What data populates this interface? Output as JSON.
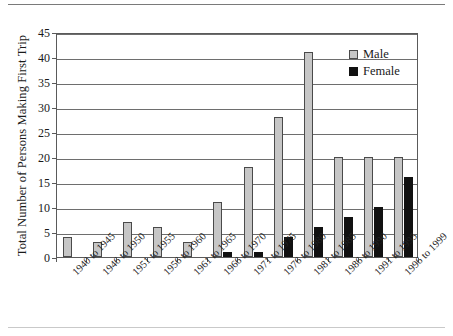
{
  "chart_data": {
    "type": "bar",
    "title": "",
    "subtitle": "",
    "xlabel": "",
    "ylabel": "Total Number of Persons Making First Trip",
    "ylim": [
      0,
      45
    ],
    "ytick_step": 5,
    "yticks": [
      "0",
      "5",
      "10",
      "15",
      "20",
      "25",
      "30",
      "35",
      "40",
      "45"
    ],
    "grid": true,
    "grid_axis": "y",
    "legend_position": "top-right",
    "categories": [
      "1940 to 1945",
      "1946 to 1950",
      "1951 to 1955",
      "1956 to 1960",
      "1961 to 1965",
      "1966 to 1970",
      "1971 to 1975",
      "1976 to 1980",
      "1981 to 1985",
      "1986 to 1990",
      "1991 to 1995",
      "1996 to 1999"
    ],
    "series": [
      {
        "name": "Male",
        "color": "#c6c6c6",
        "values": [
          4,
          3,
          7,
          6,
          3,
          11,
          18,
          28,
          41,
          20,
          20,
          20
        ]
      },
      {
        "name": "Female",
        "color": "#111111",
        "values": [
          0,
          0,
          0,
          0,
          0,
          1,
          1,
          4,
          6,
          8,
          10,
          16
        ]
      }
    ]
  },
  "legend": {
    "items": [
      {
        "label": "Male",
        "color": "#c6c6c6"
      },
      {
        "label": "Female",
        "color": "#111111"
      }
    ]
  },
  "colors": {
    "male": "#c6c6c6",
    "female": "#111111",
    "axis": "#5a5a5a",
    "grid": "#6e6e6e",
    "background": "#ffffff"
  }
}
